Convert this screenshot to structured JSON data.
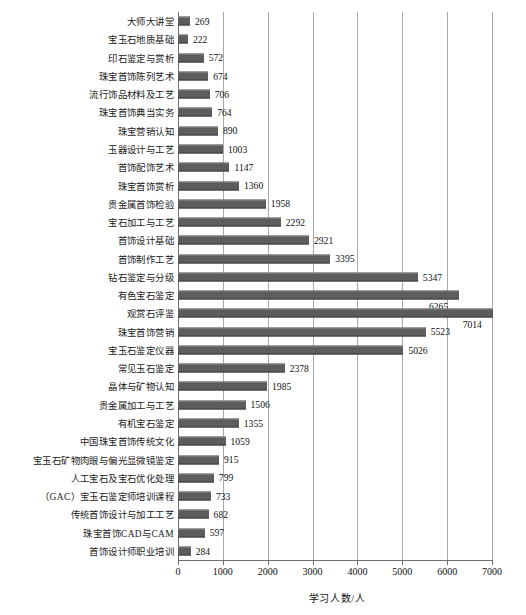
{
  "chart_data": {
    "type": "bar",
    "orientation": "horizontal",
    "title": "",
    "xlabel": "学习人数/人",
    "ylabel": "",
    "xlim": [
      0,
      7000
    ],
    "xticks": [
      0,
      1000,
      2000,
      3000,
      4000,
      5000,
      6000,
      7000
    ],
    "xtick_labels": [
      "0",
      "1000",
      "2000",
      "3000",
      "4000",
      "5000",
      "6000",
      "7000"
    ],
    "grid": true,
    "grid_axis": "x",
    "legend": null,
    "bar_color": "#5d5d5d",
    "categories": [
      "大师大讲堂",
      "宝玉石地质基础",
      "印石鉴定与赏析",
      "珠宝首饰陈列艺术",
      "流行饰品材料及工艺",
      "珠宝首饰典当实务",
      "珠宝营销认知",
      "玉器设计与工艺",
      "首饰配饰艺术",
      "珠宝首饰赏析",
      "贵金属首饰检验",
      "宝石加工与工艺",
      "首饰设计基础",
      "首饰制作工艺",
      "钻石鉴定与分级",
      "有色宝石鉴定",
      "观赏石评鉴",
      "珠宝首饰营销",
      "宝玉石鉴定仪器",
      "常见玉石鉴定",
      "晶体与矿物认知",
      "贵金属加工与工艺",
      "有机宝石鉴定",
      "中国珠宝首饰传统文化",
      "宝玉石矿物肉眼与偏光显微镜鉴定",
      "人工宝石及宝石优化处理",
      "（GAC）宝玉石鉴定师培训课程",
      "传统首饰设计与加工工艺",
      "珠宝首饰CAD与CAM",
      "首饰设计师职业培训"
    ],
    "values": [
      269,
      222,
      572,
      674,
      706,
      764,
      890,
      1003,
      1147,
      1360,
      1958,
      2292,
      2921,
      3395,
      5347,
      6265,
      7014,
      5523,
      5026,
      2378,
      1985,
      1506,
      1355,
      1059,
      915,
      799,
      733,
      682,
      597,
      284
    ],
    "value_labels": [
      "269",
      "222",
      "572",
      "674",
      "706",
      "764",
      "890",
      "1003",
      "1147",
      "1360",
      "1958",
      "2292",
      "2921",
      "3395",
      "5347",
      "6265",
      "7014",
      "5523",
      "5026",
      "2378",
      "1985",
      "1506",
      "1355",
      "1059",
      "915",
      "799",
      "733",
      "682",
      "597",
      "284"
    ]
  }
}
